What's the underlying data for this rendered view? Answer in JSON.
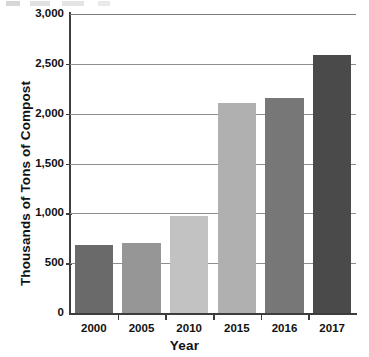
{
  "chart_data": {
    "type": "bar",
    "title": "",
    "xlabel": "Year",
    "ylabel": "Thousands of Tons of Compost",
    "categories": [
      "2000",
      "2005",
      "2010",
      "2015",
      "2016",
      "2017"
    ],
    "values": [
      685,
      700,
      975,
      2105,
      2155,
      2585
    ],
    "series": [
      {
        "name": "Compost",
        "values": [
          685,
          700,
          975,
          2105,
          2155,
          2585
        ]
      }
    ],
    "ylim": [
      0,
      3000
    ],
    "ytick_values": [
      0,
      500,
      1000,
      1500,
      2000,
      2500,
      3000
    ],
    "ytick_labels": [
      "0",
      "500",
      "1,000",
      "1,500",
      "2,000",
      "2,500",
      "3,000"
    ],
    "grid": true,
    "grid_axis": "y",
    "legend": false,
    "legend_position": "none",
    "bar_colors": [
      "#6a6a6a",
      "#969696",
      "#c2c2c2",
      "#b0b0b0",
      "#777777",
      "#4a4a4a"
    ],
    "axis_color": "#3d3d3d",
    "gridline_color": "#8e8e8e",
    "background_color": "#ffffff"
  },
  "axes": {
    "y_title": "Thousands of Tons of Compost",
    "x_title": "Year"
  }
}
